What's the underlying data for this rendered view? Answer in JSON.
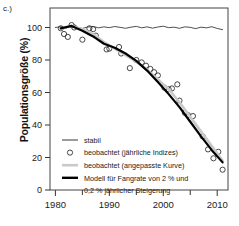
{
  "panel": {
    "label": "c.)"
  },
  "axes": {
    "ylabel": "Populationsgröße (%)",
    "xlabel": "",
    "yticks": [
      0,
      20,
      40,
      60,
      80,
      100
    ],
    "ytick_labels": [
      "0",
      "20",
      "40",
      "60",
      "80",
      "100"
    ],
    "xticks": [
      1980,
      1990,
      2000,
      2010
    ],
    "xtick_labels": [
      "1980",
      "1990",
      "2000",
      "2010"
    ],
    "xminor": [
      1985,
      1995,
      2005
    ],
    "xlim": [
      1979,
      2012
    ],
    "ylim": [
      0,
      112
    ],
    "grid": false
  },
  "legend": {
    "position": "lower-left-inside",
    "entries": [
      {
        "label": "stabil",
        "marker": "thin-line",
        "color": "#222222"
      },
      {
        "label": "beobachtet (jährliche Indizes)",
        "marker": "open-circle",
        "color": "#333333"
      },
      {
        "label": "beobachtet (angepasste Kurve)",
        "marker": "thick-line",
        "color": "#c9c9c9"
      },
      {
        "label": "Modell für Fangrate von 2 % und",
        "marker": "thick-line",
        "color": "#000000"
      },
      {
        "label": "0,2 % jährlicher Steigerung",
        "marker": "none",
        "color": "#000000"
      }
    ]
  },
  "chart_data": {
    "type": "line",
    "title": "",
    "xlabel": "",
    "ylabel": "Populationsgröße (%)",
    "xlim": [
      1979,
      2012
    ],
    "ylim": [
      0,
      112
    ],
    "series": [
      {
        "name": "stabil",
        "style": "thin-line",
        "color": "#222222",
        "x": [
          1980,
          1981,
          1982,
          1983,
          1984,
          1985,
          1986,
          1987,
          1988,
          1989,
          1990,
          1991,
          1992,
          1993,
          1994,
          1995,
          1996,
          1997,
          1998,
          1999,
          2000,
          2001,
          2002,
          2003,
          2004,
          2005,
          2006,
          2007,
          2008,
          2009,
          2010,
          2011
        ],
        "values": [
          100,
          100.5,
          99.6,
          101.2,
          100.2,
          99.4,
          100.3,
          100.6,
          99.8,
          100.4,
          99.9,
          100.6,
          100.1,
          99.5,
          100.2,
          100.7,
          99.8,
          100.4,
          99.6,
          100.3,
          100.8,
          99.9,
          100.2,
          99.5,
          100.4,
          100.1,
          99.3,
          100.2,
          99.8,
          100.5,
          99.4,
          98.7
        ]
      },
      {
        "name": "beobachtet (jährliche Indizes)",
        "style": "open-circle",
        "color": "#333333",
        "x": [
          1981,
          1981.6,
          1982.3,
          1983,
          1983.5,
          1985,
          1986.3,
          1987,
          1987.5,
          1989.5,
          1990,
          1991.8,
          1992.2,
          1993.8,
          1995,
          1996,
          1996.8,
          1997.6,
          1998.3,
          1999,
          2000.2,
          2001,
          2001.6,
          2002.6,
          2003,
          2004,
          2004.6,
          2005.5,
          2007.3,
          2008.3,
          2009.3,
          2010.2,
          2011
        ],
        "values": [
          99.5,
          96.0,
          94.2,
          101.5,
          100.0,
          92.5,
          99.5,
          99.0,
          95.0,
          86.5,
          87.0,
          88.0,
          84.0,
          75.0,
          80.0,
          78.5,
          76.5,
          74.5,
          72.5,
          70.5,
          63.0,
          62.0,
          62.5,
          65.0,
          55.0,
          47.5,
          46.0,
          45.5,
          33.0,
          25.0,
          19.5,
          23.5,
          12.5
        ]
      },
      {
        "name": "beobachtet (angepasste Kurve)",
        "style": "thick-line",
        "color": "#c9c9c9",
        "x": [
          1981,
          1983,
          1985,
          1987,
          1989,
          1991,
          1993,
          1995,
          1997,
          1999,
          2001,
          2003,
          2005,
          2007,
          2009,
          2011
        ],
        "values": [
          99.0,
          101.0,
          99.0,
          96.0,
          91.0,
          87.0,
          83.0,
          79.0,
          74.0,
          68.0,
          62.0,
          54.0,
          45.0,
          36.0,
          27.0,
          18.0
        ]
      },
      {
        "name": "Modell für Fangrate von 2 % und 0,2 % jährlicher Steigerung",
        "style": "thick-line",
        "color": "#000000",
        "x": [
          1981,
          1983,
          1985,
          1987,
          1989,
          1991,
          1993,
          1995,
          1997,
          1999,
          2001,
          2003,
          2005,
          2007,
          2009,
          2011
        ],
        "values": [
          99.5,
          101.0,
          98.0,
          94.5,
          90.0,
          87.5,
          84.0,
          79.5,
          73.5,
          66.5,
          59.0,
          51.0,
          42.0,
          33.0,
          24.5,
          17.0
        ]
      }
    ]
  }
}
